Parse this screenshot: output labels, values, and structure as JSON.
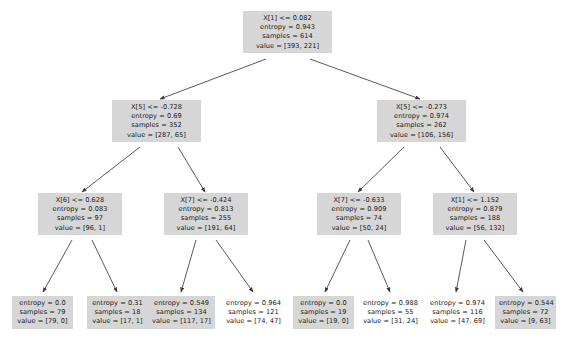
{
  "diagram": {
    "type": "decision-tree",
    "node_fill_color": "#d6d6d6",
    "edge_color": "#3a3a3a",
    "background_color": "#ffffff",
    "labels": {
      "entropy": "entropy",
      "samples": "samples",
      "value": "value"
    },
    "nodes": [
      {
        "id": "root",
        "condition": "X[1] <= 0.082",
        "entropy": "entropy = 0.943",
        "samples": "samples = 614",
        "value": "value = [393, 221]",
        "filled": true
      },
      {
        "id": "n-l1",
        "condition": "X[5] <= -0.728",
        "entropy": "entropy = 0.69",
        "samples": "samples = 352",
        "value": "value = [287, 65]",
        "filled": true
      },
      {
        "id": "n-r1",
        "condition": "X[5] <= -0.273",
        "entropy": "entropy = 0.974",
        "samples": "samples = 262",
        "value": "value = [106, 156]",
        "filled": true
      },
      {
        "id": "n-ll2",
        "condition": "X[6] <= 0.628",
        "entropy": "entropy = 0.083",
        "samples": "samples = 97",
        "value": "value = [96, 1]",
        "filled": true
      },
      {
        "id": "n-lr2",
        "condition": "X[7] <= -0.424",
        "entropy": "entropy = 0.813",
        "samples": "samples = 255",
        "value": "value = [191, 64]",
        "filled": true
      },
      {
        "id": "n-rl2",
        "condition": "X[7] <= -0.633",
        "entropy": "entropy = 0.909",
        "samples": "samples = 74",
        "value": "value = [50, 24]",
        "filled": true
      },
      {
        "id": "n-rr2",
        "condition": "X[1] <= 1.152",
        "entropy": "entropy = 0.879",
        "samples": "samples = 188",
        "value": "value = [56, 132]",
        "filled": true
      }
    ],
    "leaves": [
      {
        "id": "leaf-1",
        "entropy": "entropy = 0.0",
        "samples": "samples = 79",
        "value": "value = [79, 0]",
        "filled": true
      },
      {
        "id": "leaf-2",
        "entropy": "entropy = 0.31",
        "samples": "samples = 18",
        "value": "value = [17, 1]",
        "filled": true
      },
      {
        "id": "leaf-3",
        "entropy": "entropy = 0.549",
        "samples": "samples = 134",
        "value": "value = [117, 17]",
        "filled": true
      },
      {
        "id": "leaf-4",
        "entropy": "entropy = 0.964",
        "samples": "samples = 121",
        "value": "value = [74, 47]",
        "filled": false
      },
      {
        "id": "leaf-5",
        "entropy": "entropy = 0.0",
        "samples": "samples = 19",
        "value": "value = [19, 0]",
        "filled": true
      },
      {
        "id": "leaf-6",
        "entropy": "entropy = 0.988",
        "samples": "samples = 55",
        "value": "value = [31, 24]",
        "filled": false
      },
      {
        "id": "leaf-7",
        "entropy": "entropy = 0.974",
        "samples": "samples = 116",
        "value": "value = [47, 69]",
        "filled": false
      },
      {
        "id": "leaf-8",
        "entropy": "entropy = 0.544",
        "samples": "samples = 72",
        "value": "value = [9, 63]",
        "filled": true
      }
    ]
  }
}
